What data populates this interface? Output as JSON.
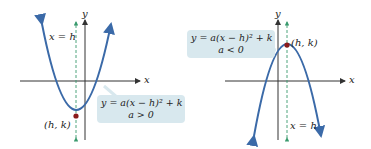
{
  "colors": {
    "curve": "#3b6aa8",
    "axis": "#333333",
    "symmetry_line": "#3a9a6e",
    "vertex": "#8b1a1a",
    "callout_bg": "#d8e8ee"
  },
  "left_graph": {
    "y_axis_label": "y",
    "x_axis_label": "x",
    "symmetry_label": "x = h",
    "vertex_label": "(h, k)",
    "equation": "y = a(x − h)² + k",
    "condition": "a > 0",
    "opens": "up"
  },
  "right_graph": {
    "y_axis_label": "y",
    "x_axis_label": "x",
    "symmetry_label": "x = h",
    "vertex_label": "(h, k)",
    "equation": "y = a(x − h)² + k",
    "condition": "a < 0",
    "opens": "down"
  }
}
